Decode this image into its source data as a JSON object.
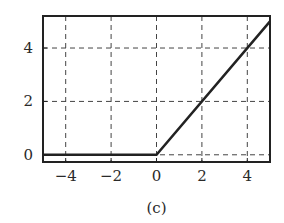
{
  "chart_data": {
    "type": "line",
    "title": "",
    "caption": "(c)",
    "xlabel": "",
    "ylabel": "",
    "xlim": [
      -5,
      5
    ],
    "ylim": [
      -0.27,
      5.2
    ],
    "xticks": [
      -4,
      -2,
      0,
      2,
      4
    ],
    "xtick_labels": [
      "−4",
      "−2",
      "0",
      "2",
      "4"
    ],
    "yticks": [
      0,
      2,
      4
    ],
    "ytick_labels": [
      "0",
      "2",
      "4"
    ],
    "grid": true,
    "grid_style": "dashed",
    "legend": "none",
    "series": [
      {
        "name": "ReLU",
        "x": [
          -5,
          0,
          5
        ],
        "y": [
          0,
          0,
          5
        ],
        "color": "#222222"
      }
    ]
  }
}
